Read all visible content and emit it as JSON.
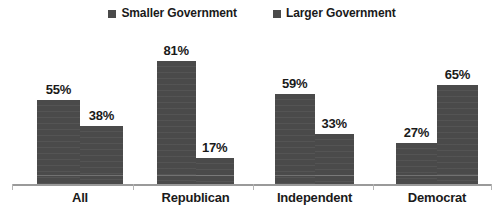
{
  "chart_data": {
    "type": "bar",
    "title": "",
    "subtitle": "",
    "xlabel": "",
    "ylabel": "",
    "ylim": [
      0,
      100
    ],
    "grid": false,
    "legend_position": "top-center",
    "categories": [
      "All",
      "Republican",
      "Independent",
      "Democrat"
    ],
    "series": [
      {
        "name": "Smaller Government",
        "color": "#4a4a4a",
        "values": [
          55,
          81,
          59,
          27
        ],
        "value_labels": [
          "55%",
          "81%",
          "59%",
          "27%"
        ]
      },
      {
        "name": "Larger Government",
        "color": "#4a4a4a",
        "values": [
          38,
          17,
          33,
          65
        ],
        "value_labels": [
          "38%",
          "17%",
          "33%",
          "65%"
        ]
      }
    ]
  },
  "legend": {
    "items": [
      {
        "label": "Smaller Government",
        "marker": "square-marker",
        "color": "#4a4a4a"
      },
      {
        "label": "Larger Government",
        "marker": "square-marker",
        "color": "#4a4a4a"
      }
    ]
  },
  "axis": {
    "baseline_color": "#9a9a9a",
    "tick_color": "#b4b4b4"
  },
  "groups": [
    {
      "label": "All",
      "bars": [
        {
          "series": "Smaller Government",
          "value": 55,
          "label": "55%"
        },
        {
          "series": "Larger Government",
          "value": 38,
          "label": "38%"
        }
      ]
    },
    {
      "label": "Republican",
      "bars": [
        {
          "series": "Smaller Government",
          "value": 81,
          "label": "81%"
        },
        {
          "series": "Larger Government",
          "value": 17,
          "label": "17%"
        }
      ]
    },
    {
      "label": "Independent",
      "bars": [
        {
          "series": "Smaller Government",
          "value": 59,
          "label": "59%"
        },
        {
          "series": "Larger Government",
          "value": 33,
          "label": "33%"
        }
      ]
    },
    {
      "label": "Democrat",
      "bars": [
        {
          "series": "Smaller Government",
          "value": 27,
          "label": "27%"
        },
        {
          "series": "Larger Government",
          "value": 65,
          "label": "65%"
        }
      ]
    }
  ],
  "layout": {
    "group_left": [
      37,
      157,
      275,
      396
    ],
    "group_width": [
      86,
      77,
      79,
      82
    ],
    "tick_x": [
      12,
      133,
      253,
      373,
      491
    ],
    "px_per_percent": 1.52
  }
}
